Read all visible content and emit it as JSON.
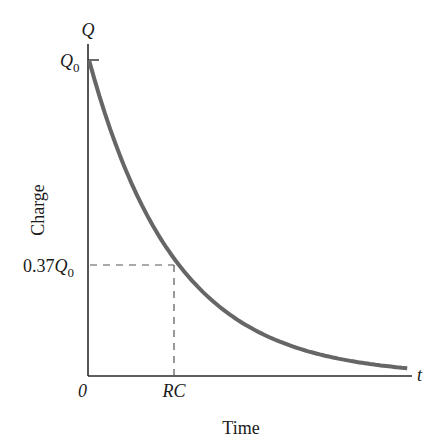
{
  "chart_data": {
    "type": "line",
    "title": "",
    "xlabel": "Time",
    "ylabel": "Charge",
    "x_axis_symbol": "t",
    "y_axis_symbol": "Q",
    "x_ticks": [
      {
        "label": "0",
        "value": 0
      },
      {
        "label": "RC",
        "value": 1
      }
    ],
    "y_ticks": [
      {
        "label": "Q0",
        "value": 1.0
      },
      {
        "label": "0.37Q0",
        "value": 0.37
      }
    ],
    "series": [
      {
        "name": "Q(t) = Q0 e^(-t/RC)",
        "color": "#666666",
        "x": [
          0,
          0.25,
          0.5,
          0.75,
          1.0,
          1.5,
          2.0,
          2.5,
          3.0,
          3.5,
          3.7
        ],
        "values": [
          1.0,
          0.78,
          0.61,
          0.47,
          0.37,
          0.22,
          0.135,
          0.082,
          0.05,
          0.03,
          0.025
        ]
      }
    ],
    "annotations": [
      {
        "type": "dashed-guide",
        "from": "0.37Q0 on y-axis",
        "to": "point (RC, 0.37Q0)",
        "then": "down to RC on x-axis"
      }
    ],
    "xlim": [
      0,
      3.8
    ],
    "ylim": [
      0,
      1.1
    ],
    "grid": false,
    "legend": "none"
  },
  "labels": {
    "y_symbol": "Q",
    "q0_main": "Q",
    "q0_sub": "0",
    "q37_prefix": "0.37",
    "q37_main": "Q",
    "q37_sub": "0",
    "origin": "0",
    "rc": "RC",
    "t_symbol": "t",
    "xlabel": "Time",
    "ylabel": "Charge"
  },
  "colors": {
    "curve": "#666666",
    "axes": "#2a2a2a",
    "guides": "#555555"
  }
}
